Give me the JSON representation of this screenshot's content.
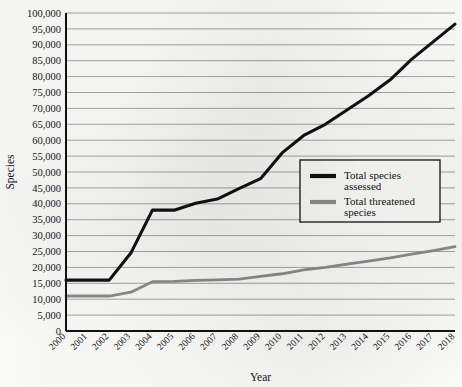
{
  "chart_data": {
    "type": "line",
    "title": "",
    "xlabel": "Year",
    "ylabel": "Species",
    "x": [
      2000,
      2001,
      2002,
      2003,
      2004,
      2005,
      2006,
      2007,
      2008,
      2009,
      2010,
      2011,
      2012,
      2013,
      2014,
      2015,
      2016,
      2017,
      2018
    ],
    "categories": [
      "2000",
      "2001",
      "2002",
      "2003",
      "2004",
      "2005",
      "2006",
      "2007",
      "2008",
      "2009",
      "2010",
      "2011",
      "2012",
      "2013",
      "2014",
      "2015",
      "2016",
      "2017",
      "2018"
    ],
    "xlim": [
      2000,
      2018
    ],
    "ylim": [
      0,
      100000
    ],
    "ytick_step": 5000,
    "ytick_labels": [
      "0",
      "5,000",
      "10,000",
      "15,000",
      "20,000",
      "25,000",
      "30,000",
      "35,000",
      "40,000",
      "45,000",
      "50,000",
      "55,000",
      "60,000",
      "65,000",
      "70,000",
      "75,000",
      "80,000",
      "85,000",
      "90,000",
      "95,000",
      "100,000"
    ],
    "grid": "horizontal",
    "legend_position": "center-right",
    "series": [
      {
        "name": "Total species assessed",
        "color": "#111111",
        "values": [
          16000,
          16000,
          16000,
          24500,
          38000,
          38000,
          40200,
          41500,
          44800,
          47900,
          56000,
          61500,
          65000,
          69500,
          74000,
          79000,
          85500,
          91000,
          96500
        ]
      },
      {
        "name": "Total threatened species",
        "color": "#8c8c8c",
        "values": [
          11000,
          11000,
          11000,
          12200,
          15500,
          15600,
          15900,
          16100,
          16300,
          17200,
          18000,
          19200,
          20000,
          21000,
          22000,
          23000,
          24200,
          25300,
          26500
        ]
      }
    ]
  },
  "legend": {
    "entries": [
      {
        "label_line1": "Total species",
        "label_line2": "assessed"
      },
      {
        "label_line1": "Total threatened",
        "label_line2": "species"
      }
    ]
  }
}
